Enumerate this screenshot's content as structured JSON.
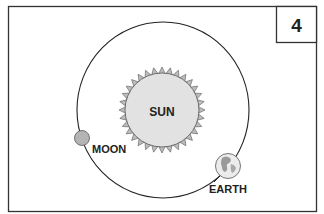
{
  "panel_number": "4",
  "labels": {
    "sun": "SUN",
    "moon": "MOON",
    "earth": "EARTH"
  },
  "colors": {
    "frame": "#333333",
    "sun_fill": "#e2e2e2",
    "moon_fill": "#b4b4b4",
    "earth_fill": "#e8e8e8",
    "orbit": "#222222"
  }
}
